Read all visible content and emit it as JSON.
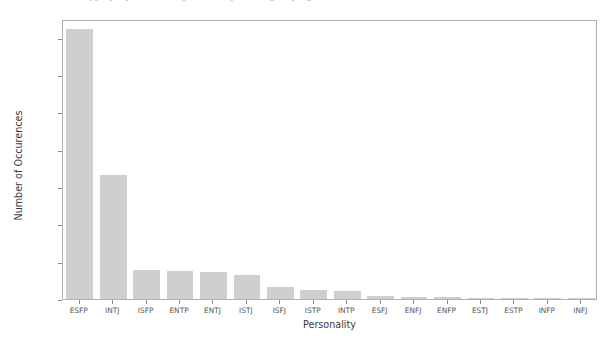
{
  "top_clipped_text": "a  unicode  of  the  type  properties  of  a  personality  of  the  grouping  bar",
  "figure": {
    "background_color": "#ffffff",
    "frame_color": "#b0b0b0"
  },
  "chart_data": {
    "type": "bar",
    "title": "",
    "xlabel": "Personality",
    "ylabel": "Number of Occurences",
    "categories": [
      "ESFP",
      "INTJ",
      "ISFP",
      "ENTP",
      "ENTJ",
      "ISTJ",
      "ISFJ",
      "ISTP",
      "INTP",
      "ESFJ",
      "ENFJ",
      "ENFP",
      "ESTJ",
      "ESTP",
      "INFP",
      "INFJ"
    ],
    "values": [
      144500,
      66300,
      15600,
      14800,
      14300,
      12800,
      6400,
      4600,
      4400,
      1500,
      1100,
      900,
      550,
      350,
      250,
      200
    ],
    "bar_color": "#cfcfcf",
    "ylim": [
      0,
      150000
    ],
    "yticks": [
      0,
      20000,
      40000,
      60000,
      80000,
      100000,
      120000,
      140000
    ],
    "ytick_labels": [
      "0",
      "20000",
      "40000",
      "60000",
      "80000",
      "100000",
      "120000",
      "140000"
    ],
    "grid": false,
    "legend": null
  }
}
